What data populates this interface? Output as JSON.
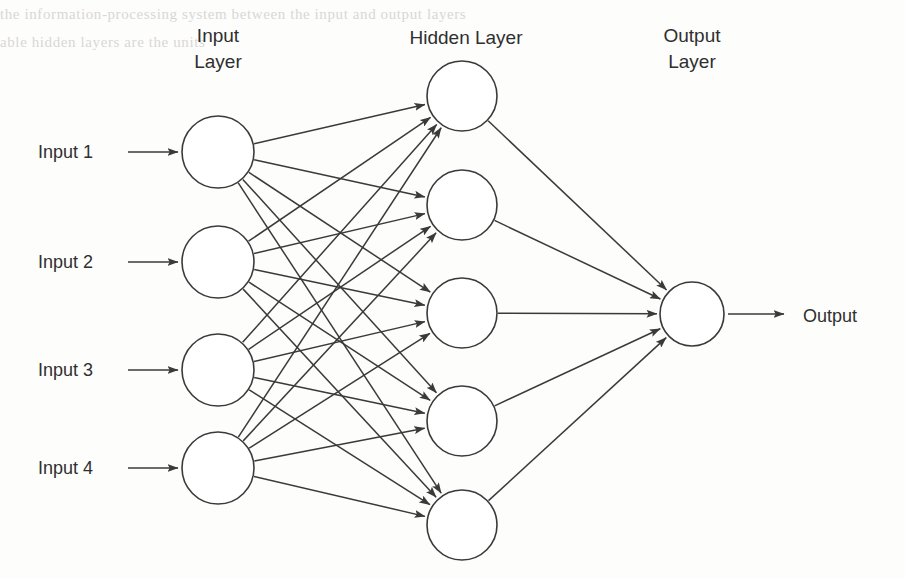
{
  "diagram": {
    "background_color": "#fdfdfc",
    "stroke_color": "#3a3a3a",
    "text_color": "#2f2f2f",
    "node_fill": "#ffffff"
  },
  "scan_artifacts": {
    "description": "faint bleed-through text from reverse page",
    "color": "#d9d7d4",
    "line1": "the information-processing system between the input and output layers",
    "line2": "able          hidden          layers          are          the          units"
  },
  "layers": {
    "input": {
      "title_line1": "Input",
      "title_line2": "Layer",
      "title_x": 218,
      "title_y1": 42,
      "title_y2": 68,
      "node_x": 218,
      "node_r": 36,
      "node_ys": [
        152,
        262,
        370,
        468
      ],
      "count": 4
    },
    "hidden": {
      "title_line1": "Hidden Layer",
      "title_x": 466,
      "title_y1": 44,
      "node_x": 462,
      "node_r": 35,
      "node_ys": [
        96,
        205,
        313,
        421,
        525
      ],
      "count": 5
    },
    "output": {
      "title_line1": "Output",
      "title_line2": "Layer",
      "title_x": 692,
      "title_y1": 42,
      "title_y2": 68,
      "node_x": 692,
      "node_r": 32,
      "node_ys": [
        314
      ],
      "count": 1
    }
  },
  "input_labels": [
    {
      "text": "Input 1",
      "x": 38,
      "y": 158,
      "arrow_x1": 128,
      "arrow_x2": 178,
      "arrow_y": 152
    },
    {
      "text": "Input 2",
      "x": 38,
      "y": 268,
      "arrow_x1": 128,
      "arrow_x2": 178,
      "arrow_y": 262
    },
    {
      "text": "Input 3",
      "x": 38,
      "y": 376,
      "arrow_x1": 128,
      "arrow_x2": 178,
      "arrow_y": 370
    },
    {
      "text": "Input 4",
      "x": 38,
      "y": 474,
      "arrow_x1": 128,
      "arrow_x2": 178,
      "arrow_y": 468
    }
  ],
  "output_label": {
    "text": "Output",
    "x": 803,
    "y": 322,
    "arrow_x1": 728,
    "arrow_x2": 784,
    "arrow_y": 314
  },
  "connections": {
    "input_to_hidden_note": "fully connected: 4 inputs x 5 hidden = 20 edges, arrowheads at hidden nodes",
    "hidden_to_output_note": "5 hidden nodes each send 1 edge to the single output node",
    "input_to_hidden_count": 20,
    "hidden_to_output_count": 5
  }
}
